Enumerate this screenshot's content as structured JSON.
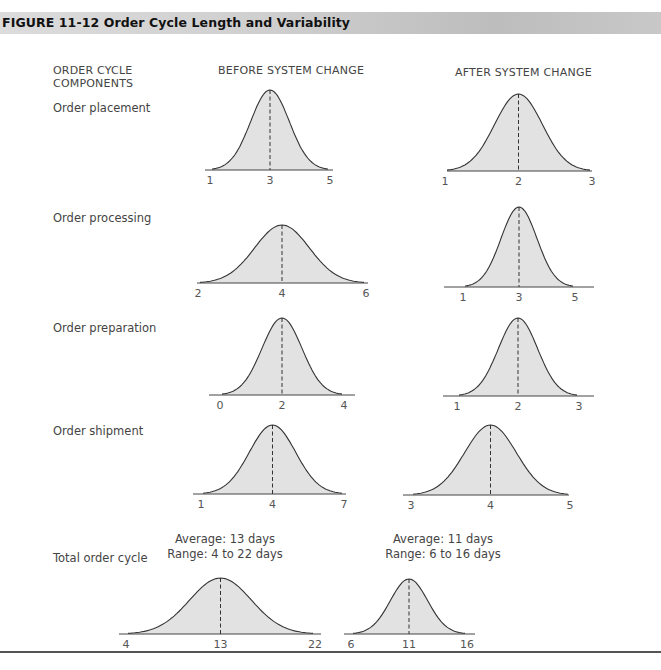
{
  "figure": {
    "title": "FIGURE 11-12   Order Cycle Length and Variability"
  },
  "columns": {
    "components_line1": "ORDER CYCLE",
    "components_line2": "COMPONENTS",
    "before": "BEFORE SYSTEM CHANGE",
    "after": "AFTER SYSTEM CHANGE"
  },
  "rows": [
    {
      "label": "Order placement"
    },
    {
      "label": "Order processing"
    },
    {
      "label": "Order preparation"
    },
    {
      "label": "Order shipment"
    },
    {
      "label": "Total order cycle"
    }
  ],
  "totals": {
    "before": {
      "average": "Average: 13 days",
      "range": "Range: 4 to 22 days"
    },
    "after": {
      "average": "Average: 11 days",
      "range": "Range: 6 to 16 days"
    }
  },
  "colors": {
    "fill": "#e2e2e2",
    "curve": "#333333",
    "header_band": "#cfcfcf"
  },
  "chart_data": {
    "type": "area",
    "title": "Order Cycle Length and Variability",
    "series": [
      {
        "component": "Order placement",
        "before": {
          "min": 1,
          "mean": 3,
          "max": 5
        },
        "after": {
          "min": 1,
          "mean": 2,
          "max": 3
        }
      },
      {
        "component": "Order processing",
        "before": {
          "min": 2,
          "mean": 4,
          "max": 6
        },
        "after": {
          "min": 1,
          "mean": 3,
          "max": 5
        }
      },
      {
        "component": "Order preparation",
        "before": {
          "min": 0,
          "mean": 2,
          "max": 4
        },
        "after": {
          "min": 1,
          "mean": 2,
          "max": 3
        }
      },
      {
        "component": "Order shipment",
        "before": {
          "min": 1,
          "mean": 4,
          "max": 7
        },
        "after": {
          "min": 3,
          "mean": 4,
          "max": 5
        }
      },
      {
        "component": "Total order cycle",
        "before": {
          "min": 4,
          "mean": 13,
          "max": 22
        },
        "after": {
          "min": 6,
          "mean": 11,
          "max": 16
        }
      }
    ],
    "xlabel": "days",
    "ylabel": "",
    "grid": false,
    "legend": "none"
  },
  "ticks": {
    "r0b": [
      "1",
      "3",
      "5"
    ],
    "r0a": [
      "1",
      "2",
      "3"
    ],
    "r1b": [
      "2",
      "4",
      "6"
    ],
    "r1a": [
      "1",
      "3",
      "5"
    ],
    "r2b": [
      "0",
      "2",
      "4"
    ],
    "r2a": [
      "1",
      "2",
      "3"
    ],
    "r3b": [
      "1",
      "4",
      "7"
    ],
    "r3a": [
      "3",
      "4",
      "5"
    ],
    "r4b": [
      "4",
      "13",
      "22"
    ],
    "r4a": [
      "6",
      "11",
      "16"
    ]
  }
}
